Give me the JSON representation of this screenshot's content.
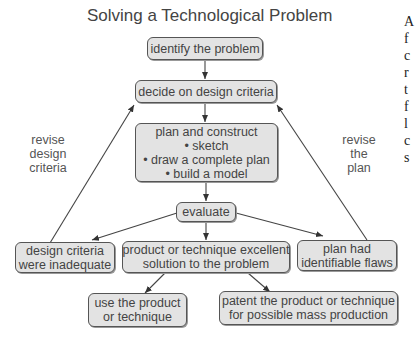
{
  "title": "Solving a Technological Problem",
  "nodes": {
    "identify": {
      "label": "identify the problem"
    },
    "criteria": {
      "label": "decide on design criteria"
    },
    "plan": {
      "heading": "plan and construct",
      "bullets": [
        "• sketch",
        "• draw a complete plan",
        "• build a model"
      ]
    },
    "evaluate": {
      "label": "evaluate"
    },
    "inadequate": {
      "line1": "design criteria",
      "line2": "were inadequate"
    },
    "excellent": {
      "line1": "product or technique excellent",
      "line2": "solution to the problem"
    },
    "flaws": {
      "line1": "plan had",
      "line2": "identifiable flaws"
    },
    "use": {
      "line1": "use the product",
      "line2": "or technique"
    },
    "patent": {
      "line1": "patent the product or technique",
      "line2": "for possible mass production"
    }
  },
  "edge_labels": {
    "revise_criteria": [
      "revise",
      "design",
      "criteria"
    ],
    "revise_plan": [
      "revise",
      "the",
      "plan"
    ]
  },
  "edges": [
    {
      "from": "identify the problem",
      "to": "decide on design criteria"
    },
    {
      "from": "decide on design criteria",
      "to": "plan and construct"
    },
    {
      "from": "plan and construct",
      "to": "evaluate"
    },
    {
      "from": "evaluate",
      "to": "design criteria were inadequate"
    },
    {
      "from": "evaluate",
      "to": "product or technique excellent solution to the problem"
    },
    {
      "from": "evaluate",
      "to": "plan had identifiable flaws"
    },
    {
      "from": "design criteria were inadequate",
      "to": "decide on design criteria",
      "label": "revise design criteria"
    },
    {
      "from": "plan had identifiable flaws",
      "to": "decide on design criteria",
      "label": "revise the plan"
    },
    {
      "from": "product or technique excellent solution to the problem",
      "to": "use the product or technique"
    },
    {
      "from": "product or technique excellent solution to the problem",
      "to": "patent the product or technique for possible mass production"
    }
  ],
  "cropped_text_right_edge": [
    "A",
    "f",
    "c",
    "r",
    "t",
    "f",
    "l",
    "c",
    "s"
  ]
}
